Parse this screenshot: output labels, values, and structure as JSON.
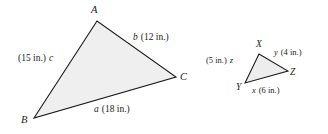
{
  "figure": {
    "background_color": "#ffffff",
    "stroke_color": "#1a1a1a",
    "fill_color": "#efefef",
    "triangles": [
      {
        "name": "triangle-abc",
        "vertices": [
          {
            "label": "A",
            "x": 97,
            "y": 21
          },
          {
            "label": "B",
            "x": 34,
            "y": 118
          },
          {
            "label": "C",
            "x": 176,
            "y": 77
          }
        ],
        "sides": [
          {
            "symbol": "a",
            "measure": "(18 in.)",
            "text": "a (18 in.)",
            "between": "B-C"
          },
          {
            "symbol": "b",
            "measure": "(12 in.)",
            "text": "b (12 in.)",
            "between": "A-C"
          },
          {
            "symbol": "c",
            "measure": "(15 in.)",
            "text": "(15 in.) c",
            "between": "A-B"
          }
        ]
      },
      {
        "name": "triangle-xyz",
        "vertices": [
          {
            "label": "X",
            "x": 259,
            "y": 54
          },
          {
            "label": "Y",
            "x": 245,
            "y": 83
          },
          {
            "label": "Z",
            "x": 288,
            "y": 71
          }
        ],
        "sides": [
          {
            "symbol": "x",
            "measure": "(6 in.)",
            "text": "x (6 in.)",
            "between": "Y-Z"
          },
          {
            "symbol": "y",
            "measure": "(4 in.)",
            "text": "y (4 in.)",
            "between": "X-Z"
          },
          {
            "symbol": "z",
            "measure": "(5 in.)",
            "text": "(5 in.) z",
            "between": "X-Y"
          }
        ]
      }
    ],
    "labels": {
      "vertex_a": "A",
      "vertex_b": "B",
      "vertex_c": "C",
      "vertex_x": "X",
      "vertex_y": "Y",
      "vertex_z": "Z",
      "side_a_symbol": "a",
      "side_a_measure": "(18 in.)",
      "side_b_symbol": "b",
      "side_b_measure": "(12 in.)",
      "side_c_symbol": "c",
      "side_c_measure": "(15 in.)",
      "side_x_symbol": "x",
      "side_x_measure": "(6 in.)",
      "side_y_symbol": "y",
      "side_y_measure": "(4 in.)",
      "side_z_symbol": "z",
      "side_z_measure": "(5 in.)"
    }
  }
}
